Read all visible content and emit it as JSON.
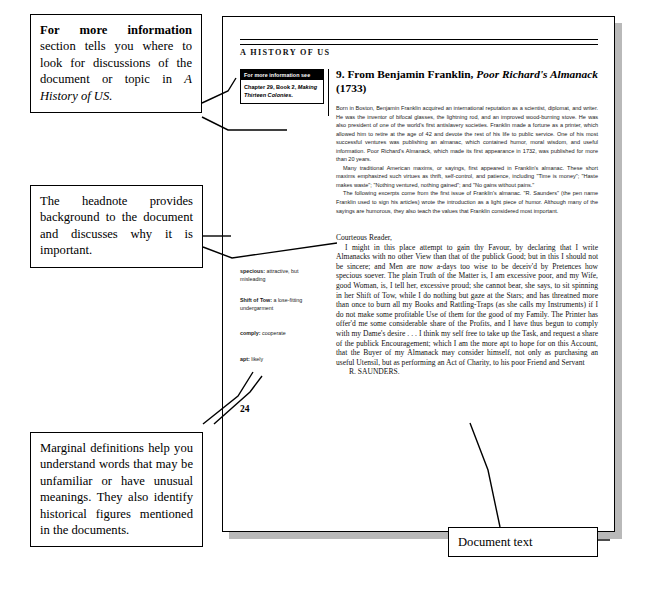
{
  "annotations": {
    "for_more_information": {
      "lead_bold": "For more information",
      "rest": " section tells you where to look for discussions of the document or topic in ",
      "italic_tail": "A History of US."
    },
    "headnote_note": "The headnote provides background to the document and discusses why it is important.",
    "marginal_note": "Marginal definitions help you understand words that may be unfamiliar or have unusual meanings. They also identify historical figures mentioned in the documents.",
    "document_text_note": "Document text"
  },
  "page": {
    "running_head": "A HISTORY OF US",
    "folio": "24",
    "for_more_info_box": {
      "header": "For more information see",
      "body_plain": "Chapter 29, Book 2, ",
      "body_italic": "Making Thirteen Colonies",
      "body_end": "."
    },
    "article": {
      "title_plain_1": "9. From Benjamin Franklin, ",
      "title_italic": "Poor Richard's Almanack",
      "title_plain_2": " (1733)",
      "headnote": [
        "Born in Boston, Benjamin Franklin acquired an international reputation as a scientist, diplomat, and writer. He was the inventor of bifocal glasses, the lightning rod, and an improved wood-burning stove. He was also president of one of the world's first antislavery societies. Franklin made a fortune as a printer, which allowed him to retire at the age of 42 and devote the rest of his life to public service. One of his most successful ventures was publishing an almanac, which contained humor, moral wisdom, and useful information. Poor Richard's Almanack, which made its first appearance in 1732, was published for more than 20 years.",
        "Many traditional American maxims, or sayings, first appeared in Franklin's almanac. These short maxims emphasized such virtues as thrift, self-control, and patience, including \"Time is money\"; \"Haste makes waste\"; \"Nothing ventured, nothing gained\"; and \"No gains without pains.\"",
        "The following excerpts come from the first issue of Franklin's almanac. \"R. Saunders\" (the pen name Franklin used to sign his articles) wrote the introduction as a light piece of humor. Although many of the sayings are humorous, they also teach the values that Franklin considered most important."
      ],
      "document": [
        "Courteous Reader,",
        "I might in this place attempt to gain thy Favour, by declaring that I write Almanacks with no other View than that of the publick Good; but in this I should not be sincere; and Men are now a-days too wise to be deceiv'd by Pretences how specious soever. The plain Truth of the Matter is, I am excessive poor, and my Wife, good Woman, is, I tell her, excessive proud; she cannot bear, she says, to sit spinning in her Shift of Tow, while I do nothing but gaze at the Stars; and has threatned more than once to burn all my Books and Rattling-Traps (as she calls my Instruments) if I do not make some profitable Use of them for the good of my Family. The Printer has offer'd me some considerable share of the Profits, and I have thus begun to comply with my Dame's desire . . . I think my self free to take up the Task, and request a share of the publick Encouragement; which I am the more apt to hope for on this Account, that the Buyer of my Almanack may consider himself, not only as purchasing an useful Utensil, but as performing an Act of Charity, to his poor Friend and Servant",
        "R. SAUNDERS."
      ]
    },
    "glossary": [
      {
        "term": "specious:",
        "definition": " attractive, but misleading"
      },
      {
        "term": "Shift of Tow:",
        "definition": " a lose-fitting undergarment"
      },
      {
        "term": "comply:",
        "definition": " cooperate"
      },
      {
        "term": "apt:",
        "definition": " likely"
      }
    ]
  },
  "colors": {
    "ink": "#000000",
    "page": "#ffffff",
    "shadow": "#b9b9b9",
    "body_ink": "#1a1a1a"
  }
}
